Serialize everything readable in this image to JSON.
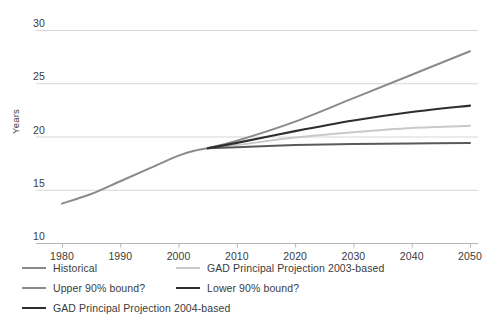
{
  "chart_data": {
    "type": "line",
    "title": "",
    "xlabel": "",
    "ylabel": "Years",
    "xlim": [
      1975,
      2053
    ],
    "ylim": [
      10,
      30
    ],
    "grid": true,
    "legend_position": "bottom-left",
    "x_ticks": [
      "1980",
      "1990",
      "2000",
      "2010",
      "2020",
      "2030",
      "2040",
      "2050"
    ],
    "y_ticks": [
      "10",
      "15",
      "20",
      "25",
      "30"
    ],
    "series": [
      {
        "name": "Historical",
        "color": "#8a8a8a",
        "width": 2.0,
        "x": [
          1980,
          1985,
          1990,
          1995,
          2000,
          2003,
          2005
        ],
        "values": [
          13.7,
          14.6,
          15.8,
          17.0,
          18.2,
          18.7,
          18.9
        ]
      },
      {
        "name": "Upper 90% bound?",
        "color": "#8a8a8a",
        "width": 2.0,
        "x": [
          2005,
          2010,
          2020,
          2030,
          2040,
          2050
        ],
        "values": [
          18.9,
          19.6,
          21.4,
          23.6,
          25.8,
          28.0
        ]
      },
      {
        "name": "GAD Principal Projection 2004-based",
        "color": "#2e2e2e",
        "width": 2.2,
        "x": [
          2005,
          2010,
          2020,
          2030,
          2040,
          2050
        ],
        "values": [
          18.9,
          19.4,
          20.5,
          21.5,
          22.3,
          22.9
        ]
      },
      {
        "name": "GAD Principal Projection 2003-based",
        "color": "#c9c9c9",
        "width": 2.0,
        "x": [
          2005,
          2010,
          2020,
          2030,
          2040,
          2050
        ],
        "values": [
          18.9,
          19.2,
          19.9,
          20.4,
          20.8,
          21.0
        ]
      },
      {
        "name": "Lower 90% bound?",
        "color": "#5a5a5a",
        "width": 2.0,
        "x": [
          2005,
          2010,
          2020,
          2030,
          2040,
          2050
        ],
        "values": [
          18.9,
          19.0,
          19.2,
          19.3,
          19.35,
          19.4
        ]
      }
    ]
  },
  "axis": {
    "ylabel": "Years",
    "y_ticks": [
      "30",
      "25",
      "20",
      "15",
      "10"
    ],
    "x_ticks": [
      "1980",
      "1990",
      "2000",
      "2010",
      "2020",
      "2030",
      "2040",
      "2050"
    ]
  },
  "legend": {
    "items": [
      {
        "label": "Historical",
        "color": "#8a8a8a",
        "width": 2.0
      },
      {
        "label": "GAD Principal Projection 2003-based",
        "color": "#c9c9c9",
        "width": 2.0
      },
      {
        "label": "Upper 90% bound?",
        "color": "#8a8a8a",
        "width": 2.0
      },
      {
        "label": "Lower 90% bound?",
        "color": "#2e2e2e",
        "width": 2.4
      },
      {
        "label": "GAD Principal Projection 2004-based",
        "color": "#2e2e2e",
        "width": 2.6
      }
    ]
  },
  "style": {
    "grid_color": "#d6d6d6",
    "axis_color": "#b4b4b4",
    "text_color": "#3b3b3b",
    "background": "#ffffff"
  }
}
